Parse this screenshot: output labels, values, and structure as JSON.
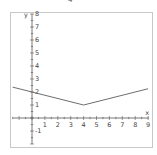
{
  "top_label": "4",
  "chart_data": {
    "type": "line",
    "title": "",
    "xlabel": "x",
    "ylabel": "y",
    "xlim": [
      -1.5,
      9
    ],
    "ylim": [
      -2,
      8
    ],
    "grid": false,
    "x_ticks": [
      1,
      2,
      3,
      4,
      5,
      6,
      7,
      8,
      9
    ],
    "y_ticks": [
      8,
      7,
      6,
      5,
      4,
      3,
      2,
      1,
      -1
    ],
    "series": [
      {
        "name": "y = |x - 4| / 4 + 1",
        "x": [
          -1.5,
          0,
          4,
          9
        ],
        "y": [
          2.375,
          2,
          1,
          2.25
        ],
        "color": "#6e6e6e"
      }
    ]
  }
}
